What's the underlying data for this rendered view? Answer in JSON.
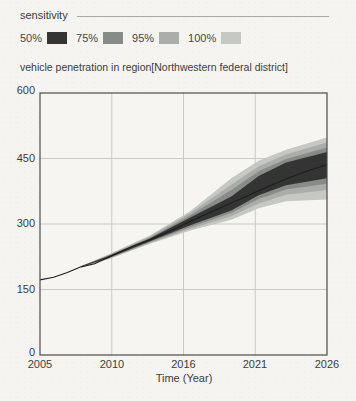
{
  "chart_data": {
    "type": "area",
    "subtype": "sensitivity-fan",
    "title": "vehicle penetration in region[Northwestern federal district]",
    "xlabel": "Time (Year)",
    "legend_title": "sensitivity",
    "legend_position": "top-left",
    "grid": true,
    "xlim": [
      2005,
      2026
    ],
    "ylim": [
      0,
      600
    ],
    "x_tick_labels": [
      "2005",
      "2010",
      "2016",
      "2021",
      "2026"
    ],
    "y_tick_labels": [
      "600",
      "450",
      "300",
      "150",
      "0"
    ],
    "bands": [
      {
        "name": "100%",
        "color": "#c6c8c3",
        "x": [
          2008,
          2010,
          2013,
          2016,
          2019,
          2021,
          2023,
          2026
        ],
        "lower": [
          201,
          219,
          254,
          285,
          310,
          336,
          352,
          356
        ],
        "upper": [
          203,
          230,
          273,
          330,
          405,
          445,
          470,
          498
        ]
      },
      {
        "name": "95%",
        "color": "#aaadaa",
        "x": [
          2008,
          2010,
          2013,
          2016,
          2019,
          2021,
          2023,
          2026
        ],
        "lower": [
          201,
          220,
          256,
          289,
          318,
          347,
          367,
          378
        ],
        "upper": [
          203,
          229,
          271,
          325,
          390,
          432,
          459,
          487
        ]
      },
      {
        "name": "75%",
        "color": "#888c89",
        "x": [
          2008,
          2010,
          2013,
          2016,
          2019,
          2021,
          2023,
          2026
        ],
        "lower": [
          202,
          221,
          258,
          293,
          325,
          357,
          379,
          392
        ],
        "upper": [
          203,
          228,
          268,
          320,
          378,
          421,
          449,
          475
        ]
      },
      {
        "name": "50%",
        "color": "#343434",
        "x": [
          2008,
          2010,
          2013,
          2016,
          2019,
          2021,
          2023,
          2026
        ],
        "lower": [
          202,
          222,
          260,
          297,
          331,
          366,
          389,
          405
        ],
        "upper": [
          203,
          226,
          266,
          315,
          363,
          410,
          441,
          465
        ]
      }
    ],
    "median": {
      "name": "base run",
      "color": "#1e1e1e",
      "x": [
        2005,
        2006,
        2007,
        2008,
        2009,
        2010,
        2011,
        2012,
        2013,
        2014,
        2015,
        2016,
        2017,
        2018,
        2019,
        2020,
        2021,
        2022,
        2023,
        2024,
        2025,
        2026
      ],
      "y": [
        172,
        178,
        189,
        202,
        209,
        224,
        238,
        252,
        263,
        277,
        291,
        306,
        320,
        334,
        348,
        362,
        376,
        390,
        403,
        415,
        426,
        436
      ]
    }
  }
}
